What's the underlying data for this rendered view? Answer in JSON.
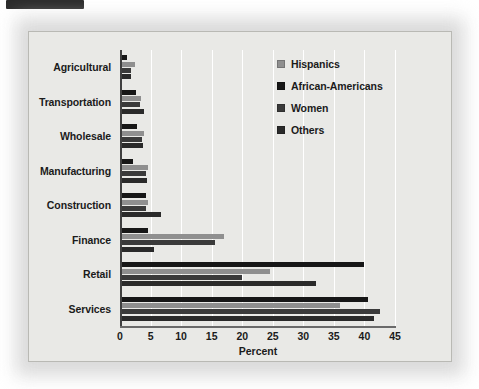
{
  "figure": {
    "background_color": "#e9e9e6",
    "border_color": "#b9b9b4"
  },
  "legend": {
    "position": "top-right",
    "entries": [
      {
        "label": "Hispanics",
        "color": "#8f8f8f"
      },
      {
        "label": "African-Americans",
        "color": "#171717"
      },
      {
        "label": "Women",
        "color": "#3a3a3a"
      },
      {
        "label": "Others",
        "color": "#2a2a2a"
      }
    ]
  },
  "axis": {
    "x_title": "Percent",
    "x_ticks": [
      "0",
      "5",
      "10",
      "15",
      "20",
      "25",
      "30",
      "35",
      "40",
      "45"
    ]
  },
  "chart_data": {
    "type": "bar",
    "orientation": "horizontal",
    "title": "",
    "subtitle": "",
    "xlabel": "Percent",
    "ylabel": "",
    "xlim": [
      0,
      45
    ],
    "xticks": [
      0,
      5,
      10,
      15,
      20,
      25,
      30,
      35,
      40,
      45
    ],
    "grid": "vertical-white-gridlines",
    "legend_position": "top-right",
    "categories": [
      "Agricultural",
      "Transportation",
      "Wholesale",
      "Manufacturing",
      "Construction",
      "Finance",
      "Retail",
      "Services"
    ],
    "series": [
      {
        "name": "Hispanics",
        "color": "#8f8f8f",
        "values": [
          2.4,
          3.4,
          4.0,
          4.6,
          4.5,
          17.0,
          24.5,
          36.0
        ]
      },
      {
        "name": "African-Americans",
        "color": "#171717",
        "values": [
          1.2,
          2.6,
          2.8,
          2.2,
          4.3,
          4.5,
          40.0,
          40.5
        ]
      },
      {
        "name": "Women",
        "color": "#3a3a3a",
        "values": [
          1.8,
          3.3,
          3.6,
          4.3,
          4.3,
          15.5,
          20.0,
          42.5
        ]
      },
      {
        "name": "Others",
        "color": "#2a2a2a",
        "values": [
          1.8,
          4.0,
          3.8,
          4.4,
          6.7,
          5.5,
          32.0,
          41.5
        ]
      }
    ],
    "bar_order_top_to_bottom": [
      "African-Americans",
      "Hispanics",
      "Women",
      "Others"
    ]
  }
}
